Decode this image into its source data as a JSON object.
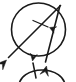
{
  "figure": {
    "background_color": "#ffffff",
    "ink_color": "#1a1a1a",
    "canvas": {
      "width": 76,
      "height": 82
    }
  },
  "shapes": {
    "main_circle": {
      "name": "main-circle",
      "center_x": 38.5,
      "center_y": 29.5,
      "radius_x": 27,
      "radius_y": 26.5,
      "stroke_width": 1.6
    },
    "lower_circle": {
      "name": "lower-partial-circle",
      "center_x": 42,
      "center_y": 86,
      "radius_x": 23,
      "radius_y": 16,
      "stroke_width": 1.6
    },
    "vertex": {
      "x": 60.5,
      "y": 5.5
    }
  },
  "lines": {
    "diagonal_chord": {
      "name": "diagonal-chord",
      "label": "long chord to lower-left",
      "x1": 60.5,
      "y1": 5.5,
      "x2": 8.5,
      "y2": 57.5,
      "stroke_width": 1.6,
      "arrow_at": "lower-left"
    },
    "steep_chord": {
      "name": "steep-chord",
      "label": "steep chord to lower-middle",
      "x1": 60.0,
      "y1": 5.5,
      "x2": 45.5,
      "y2": 62.0,
      "stroke_width": 1.6,
      "arrow_at": "lower-middle"
    },
    "angle_marker": {
      "name": "angle-marker-arrow",
      "label": "short arrow marking the angle between the chords",
      "x1": 33.0,
      "y1": 20.5,
      "x2": 48.0,
      "y2": 27.0,
      "stroke_width": 1.3,
      "arrow_at": "right"
    },
    "up_arrow": {
      "name": "up-arrow",
      "label": "arrow pointing up into lower circle",
      "x1": 36.0,
      "y1": 78.0,
      "x2": 33.0,
      "y2": 63.0,
      "stroke_width": 1.5,
      "arrow_at": "top"
    }
  },
  "arrowheads": {
    "lower_left": {
      "name": "arrowhead-lower-left",
      "tip_x": 6.5,
      "tip_y": 60.0,
      "angle_deg": 135
    },
    "lower_middle": {
      "name": "arrowhead-lower-middle",
      "tip_x": 46.5,
      "tip_y": 66.0,
      "angle_deg": 104
    },
    "angle_marker_tip": {
      "name": "arrowhead-angle-marker",
      "tip_x": 49.5,
      "tip_y": 27.5,
      "angle_deg": 23
    },
    "up_arrow_tip": {
      "name": "arrowhead-up",
      "tip_x": 32.5,
      "tip_y": 61.0,
      "angle_deg": 281
    }
  }
}
